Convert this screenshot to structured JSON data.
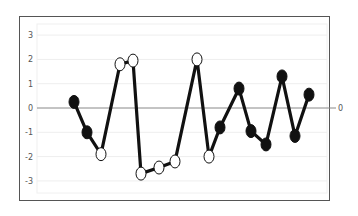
{
  "chart_data": {
    "type": "line",
    "title": "",
    "xlabel": "",
    "ylabel": "",
    "ylim": [
      -3.5,
      3.5
    ],
    "yticks": [
      3,
      2,
      1,
      0,
      -1,
      -2,
      -3
    ],
    "ytick_labels": [
      "3",
      "2",
      "1",
      "0",
      "-1",
      "-2",
      "-3"
    ],
    "grid": true,
    "legend": null,
    "zero_line_right_label": "0",
    "x": [
      1,
      2,
      3,
      4,
      5,
      6,
      7,
      8,
      9,
      10,
      11,
      12,
      13,
      14,
      15,
      16,
      17
    ],
    "values": [
      0.25,
      -1.0,
      -1.9,
      1.8,
      1.95,
      -2.7,
      -2.45,
      -2.2,
      2.0,
      -2.0,
      -0.8,
      0.8,
      -0.95,
      -1.5,
      1.3,
      -1.15,
      0.55
    ],
    "marker_fill": [
      "filled",
      "filled",
      "open",
      "open",
      "open",
      "open",
      "open",
      "open",
      "open",
      "open",
      "filled",
      "filled",
      "filled",
      "filled",
      "filled",
      "filled",
      "filled"
    ],
    "colors": {
      "line": "#111111",
      "filled_marker": "#111111",
      "open_marker": "#ffffff",
      "zero_line": "#888888",
      "frame": "#555555",
      "grid": "#eeeeee"
    }
  }
}
